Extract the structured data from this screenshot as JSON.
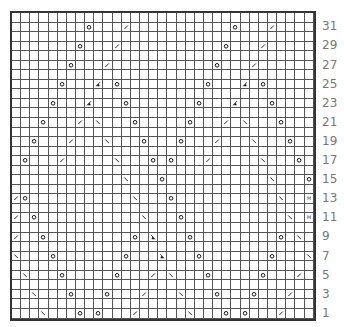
{
  "chart": {
    "columns": 33,
    "rows": 32,
    "row_labels": [
      "1",
      "3",
      "5",
      "7",
      "9",
      "11",
      "13",
      "15",
      "17",
      "19",
      "21",
      "23",
      "25",
      "27",
      "29",
      "31"
    ],
    "symbols": {
      "O": "yarn-over",
      "/": "right-slant-decrease",
      "\\": "left-slant-decrease",
      "A": "right-slant-double-decrease",
      "B": "left-slant-double-decrease",
      "M": "make-one"
    },
    "cells": {
      "31": [
        [
          8,
          "O"
        ],
        [
          12,
          "/"
        ],
        [
          24,
          "O"
        ],
        [
          28,
          "/"
        ]
      ],
      "29": [
        [
          7,
          "O"
        ],
        [
          11,
          "/"
        ],
        [
          23,
          "O"
        ],
        [
          27,
          "/"
        ]
      ],
      "27": [
        [
          6,
          "O"
        ],
        [
          10,
          "/"
        ],
        [
          22,
          "O"
        ],
        [
          26,
          "/"
        ]
      ],
      "25": [
        [
          5,
          "O"
        ],
        [
          9,
          "A"
        ],
        [
          11,
          "O"
        ],
        [
          21,
          "O"
        ],
        [
          25,
          "A"
        ],
        [
          27,
          "O"
        ]
      ],
      "23": [
        [
          4,
          "O"
        ],
        [
          8,
          "A"
        ],
        [
          12,
          "O"
        ],
        [
          20,
          "O"
        ],
        [
          24,
          "A"
        ],
        [
          28,
          "O"
        ]
      ],
      "21": [
        [
          3,
          "O"
        ],
        [
          7,
          "/"
        ],
        [
          9,
          "\\"
        ],
        [
          13,
          "O"
        ],
        [
          19,
          "O"
        ],
        [
          23,
          "/"
        ],
        [
          25,
          "\\"
        ],
        [
          29,
          "O"
        ]
      ],
      "19": [
        [
          2,
          "O"
        ],
        [
          6,
          "/"
        ],
        [
          10,
          "\\"
        ],
        [
          14,
          "O"
        ],
        [
          18,
          "O"
        ],
        [
          22,
          "/"
        ],
        [
          26,
          "\\"
        ],
        [
          30,
          "O"
        ]
      ],
      "17": [
        [
          1,
          "O"
        ],
        [
          5,
          "/"
        ],
        [
          11,
          "\\"
        ],
        [
          15,
          "O"
        ],
        [
          17,
          "O"
        ],
        [
          21,
          "/"
        ],
        [
          27,
          "\\"
        ],
        [
          31,
          "O"
        ]
      ],
      "15": [
        [
          12,
          "\\"
        ],
        [
          16,
          "O"
        ],
        [
          28,
          "\\"
        ],
        [
          32,
          "O"
        ]
      ],
      "13": [
        [
          0,
          "/"
        ],
        [
          1,
          "O"
        ],
        [
          13,
          "\\"
        ],
        [
          17,
          "O"
        ],
        [
          29,
          "\\"
        ],
        [
          32,
          "M"
        ]
      ],
      "11": [
        [
          0,
          "/"
        ],
        [
          2,
          "O"
        ],
        [
          14,
          "\\"
        ],
        [
          18,
          "O"
        ],
        [
          30,
          "\\"
        ],
        [
          32,
          "M"
        ]
      ],
      "9": [
        [
          0,
          "/"
        ],
        [
          3,
          "O"
        ],
        [
          13,
          "O"
        ],
        [
          15,
          "B"
        ],
        [
          19,
          "O"
        ],
        [
          29,
          "O"
        ],
        [
          31,
          "\\"
        ]
      ],
      "7": [
        [
          0,
          "\\"
        ],
        [
          4,
          "O"
        ],
        [
          12,
          "O"
        ],
        [
          16,
          "B"
        ],
        [
          20,
          "O"
        ],
        [
          28,
          "O"
        ],
        [
          32,
          "\\"
        ]
      ],
      "5": [
        [
          1,
          "\\"
        ],
        [
          5,
          "O"
        ],
        [
          11,
          "O"
        ],
        [
          15,
          "/"
        ],
        [
          17,
          "\\"
        ],
        [
          21,
          "O"
        ],
        [
          27,
          "O"
        ],
        [
          31,
          "/"
        ]
      ],
      "3": [
        [
          2,
          "\\"
        ],
        [
          6,
          "O"
        ],
        [
          10,
          "O"
        ],
        [
          14,
          "/"
        ],
        [
          18,
          "\\"
        ],
        [
          22,
          "O"
        ],
        [
          26,
          "O"
        ],
        [
          30,
          "/"
        ]
      ],
      "1": [
        [
          3,
          "\\"
        ],
        [
          7,
          "O"
        ],
        [
          9,
          "O"
        ],
        [
          13,
          "/"
        ],
        [
          19,
          "\\"
        ],
        [
          23,
          "O"
        ],
        [
          25,
          "O"
        ],
        [
          29,
          "/"
        ]
      ]
    }
  },
  "colors": {
    "grid_line": "#555555",
    "border": "#333333",
    "symbol": "#111111",
    "label": "#777777"
  }
}
